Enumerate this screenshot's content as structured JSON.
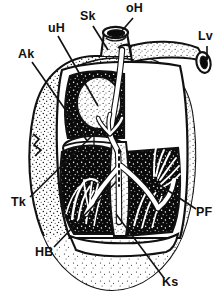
{
  "figure": {
    "type": "anatomical-illustration",
    "style": "black-and-white stipple line drawing",
    "canvas": {
      "width": 223,
      "height": 301
    },
    "colors": {
      "ink": "#111111",
      "paper": "#ffffff",
      "chamber_fill": "#0b0b0b",
      "myocardium_stipple": "#2a2a2a",
      "conduction_fill": "#ffffff"
    }
  },
  "labels": [
    {
      "id": "uH",
      "text": "uH",
      "x": 48,
      "y": 28,
      "leader": "down-right to left atrium interior"
    },
    {
      "id": "Sk",
      "text": "Sk",
      "x": 83,
      "y": 16,
      "leader": "down-right to sinus node / vessel root"
    },
    {
      "id": "oH",
      "text": "oH",
      "x": 128,
      "y": 8,
      "leader": "down-left to aortic stub opening"
    },
    {
      "id": "Lv",
      "text": "Lv",
      "x": 200,
      "y": 37,
      "leader": "straight down to right vessel stub"
    },
    {
      "id": "Ak",
      "text": "Ak",
      "x": 20,
      "y": 54,
      "leader": "down-right to atrioventricular valve ring"
    },
    {
      "id": "Tk",
      "text": "Tk",
      "x": 13,
      "y": 202,
      "leader": "up-right to tricuspid valve leaflet"
    },
    {
      "id": "HB",
      "text": "HB",
      "x": 37,
      "y": 252,
      "leader": "up-right to bundle of His in septum"
    },
    {
      "id": "Ks",
      "text": "Ks",
      "x": 163,
      "y": 282,
      "leader": "up-left to septum / bundle branch"
    },
    {
      "id": "PF",
      "text": "PF",
      "x": 198,
      "y": 212,
      "leader": "up-left to Purkinje fibre fan"
    }
  ],
  "structures": [
    {
      "name": "aorta-stub",
      "description": "cylindrical vessel stub at top centre with elliptical lumen"
    },
    {
      "name": "pulmonary-vessel-stub",
      "description": "horizontal vessel running to upper right, cut end with lumen"
    },
    {
      "name": "left-atrium",
      "description": "upper left dark stippled chamber window"
    },
    {
      "name": "right-auricle",
      "description": "lobed appendage bulging from right side"
    },
    {
      "name": "left-ventricle",
      "description": "large dark chamber left of septum with trabeculae"
    },
    {
      "name": "right-ventricle",
      "description": "dark chamber right of septum with papillary fan"
    },
    {
      "name": "interventricular-septum",
      "description": "pale vertical wall carrying conduction bundle"
    },
    {
      "name": "av-valve-ring",
      "description": "pale ellipse between atrium and ventricle"
    },
    {
      "name": "conduction-pathway",
      "description": "white branching cord from sinus node down septum into fibre fans"
    },
    {
      "name": "purkinje-fan",
      "description": "fan of fine white fibres on right ventricle wall"
    },
    {
      "name": "apex",
      "description": "rounded stippled bottom of heart"
    }
  ]
}
